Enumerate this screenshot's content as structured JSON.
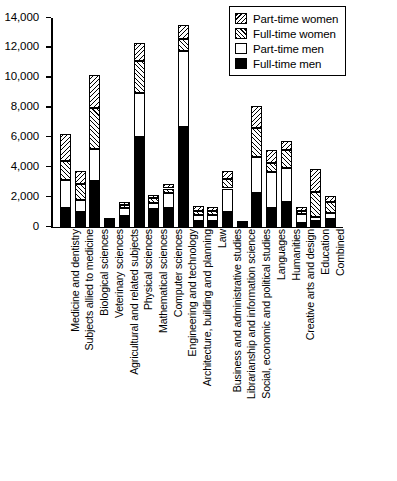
{
  "chart_data": {
    "type": "bar",
    "subtype": "stacked-vertical",
    "title": "",
    "xlabel": "",
    "ylabel": "",
    "ylim": [
      0,
      14000
    ],
    "ytick_values": [
      0,
      2000,
      4000,
      6000,
      8000,
      10000,
      12000,
      14000
    ],
    "ytick_labels": [
      "0",
      "2,000",
      "4,000",
      "6,000",
      "8,000",
      "10,000",
      "12,000",
      "14,000"
    ],
    "grid": false,
    "legend_position": "top-right",
    "stack_order_bottom_to_top": [
      "Full-time men",
      "Part-time men",
      "Full-time women",
      "Part-time women"
    ],
    "categories": [
      "Medicine and dentistry",
      "Subjects allied to medicine",
      "Biological sciences",
      "Veterinary sciences",
      "Agricultural and related subjects",
      "Physical sciences",
      "Mathematical sciences",
      "Computer sciences",
      "Engineering and technology",
      "Architecture, building and planning",
      "Law",
      "Business and administrative studies",
      "Librarianship and information science",
      "Social, economic and political studies",
      "Languages",
      "Humanities",
      "Creative arts and design",
      "Education",
      "Combined"
    ],
    "series": [
      {
        "name": "Full-time men",
        "pattern": "solid-black",
        "values": [
          1250,
          1000,
          3100,
          320,
          720,
          6000,
          1200,
          1300,
          6700,
          430,
          420,
          980,
          180,
          2250,
          1270,
          1680,
          300,
          390,
          530
        ]
      },
      {
        "name": "Part-time men",
        "pattern": "white",
        "values": [
          1900,
          800,
          2100,
          80,
          530,
          3000,
          420,
          1000,
          5100,
          380,
          400,
          1600,
          60,
          2450,
          2430,
          2250,
          560,
          260,
          430
        ]
      },
      {
        "name": "Full-time women",
        "pattern": "forward-hatch",
        "values": [
          1250,
          1100,
          2800,
          60,
          220,
          2150,
          300,
          280,
          800,
          280,
          240,
          620,
          60,
          1900,
          620,
          1200,
          200,
          1700,
          700
        ]
      },
      {
        "name": "Part-time women",
        "pattern": "backward-hatch",
        "values": [
          1800,
          850,
          2200,
          40,
          180,
          1150,
          230,
          300,
          950,
          300,
          290,
          520,
          50,
          1500,
          830,
          650,
          290,
          1550,
          420
        ]
      }
    ],
    "totals": [
      6200,
      3750,
      10200,
      500,
      1650,
      12300,
      2150,
      2880,
      13550,
      1390,
      1350,
      3720,
      350,
      8100,
      5150,
      5780,
      1350,
      3900,
      2080
    ]
  },
  "legend": {
    "items": [
      {
        "label": "Part-time women",
        "key": "ptw-swatch"
      },
      {
        "label": "Full-time women",
        "key": "ftw-swatch"
      },
      {
        "label": "Part-time men",
        "key": "ptm-swatch"
      },
      {
        "label": "Full-time men",
        "key": "ftm-swatch"
      }
    ]
  }
}
